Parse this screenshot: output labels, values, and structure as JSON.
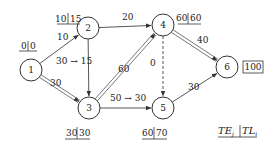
{
  "diagram": {
    "nodes": [
      {
        "id": "1",
        "label": "1",
        "te": "0",
        "tl": "0"
      },
      {
        "id": "2",
        "label": "2",
        "te": "10",
        "tl": "15"
      },
      {
        "id": "3",
        "label": "3",
        "te": "30",
        "tl": "30"
      },
      {
        "id": "4",
        "label": "4",
        "te": "60",
        "tl": "60"
      },
      {
        "id": "5",
        "label": "5",
        "te": "60",
        "tl": "70"
      },
      {
        "id": "6",
        "label": "6",
        "final": "100"
      }
    ],
    "edges": [
      {
        "from": "1",
        "to": "2",
        "duration": "10",
        "critical": false,
        "dummy": false
      },
      {
        "from": "1",
        "to": "3",
        "duration": "30",
        "critical": true,
        "dummy": false
      },
      {
        "from": "2",
        "to": "3",
        "duration": "30 → 15",
        "critical": false,
        "dummy": false
      },
      {
        "from": "2",
        "to": "4",
        "duration": "20",
        "critical": false,
        "dummy": false
      },
      {
        "from": "3",
        "to": "4",
        "duration": "60",
        "critical": true,
        "dummy": false
      },
      {
        "from": "3",
        "to": "5",
        "duration": "50 → 30",
        "critical": false,
        "dummy": false
      },
      {
        "from": "4",
        "to": "5",
        "duration": "0",
        "critical": false,
        "dummy": true
      },
      {
        "from": "4",
        "to": "6",
        "duration": "40",
        "critical": true,
        "dummy": false
      },
      {
        "from": "5",
        "to": "6",
        "duration": "30",
        "critical": false,
        "dummy": false
      }
    ],
    "legend": {
      "left": "TE",
      "left_sub": "j",
      "right": "TL",
      "right_sub": "i"
    }
  }
}
